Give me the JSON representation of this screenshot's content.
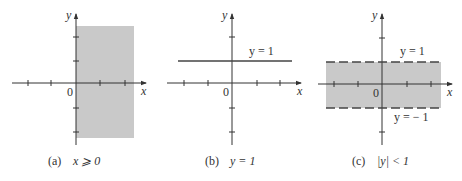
{
  "figure": {
    "panels": [
      {
        "id": "a",
        "caption_tag": "(a)",
        "caption_expr": "x ⩾ 0",
        "x_label": "x",
        "y_label": "y",
        "origin_label": "0",
        "region": "half-plane x ≥ 0 shaded"
      },
      {
        "id": "b",
        "caption_tag": "(b)",
        "caption_expr": "y = 1",
        "x_label": "x",
        "y_label": "y",
        "origin_label": "0",
        "line_label": "y = 1",
        "region": "horizontal line y = 1"
      },
      {
        "id": "c",
        "caption_tag": "(c)",
        "caption_expr": "|y| < 1",
        "x_label": "x",
        "y_label": "y",
        "origin_label": "0",
        "upper_label": "y = 1",
        "lower_label": "y = − 1",
        "region": "strip −1 < y < 1 shaded, dashed boundaries"
      }
    ],
    "colors": {
      "shade": "#c9c9c9",
      "axis": "#333333",
      "line": "#444444"
    }
  }
}
